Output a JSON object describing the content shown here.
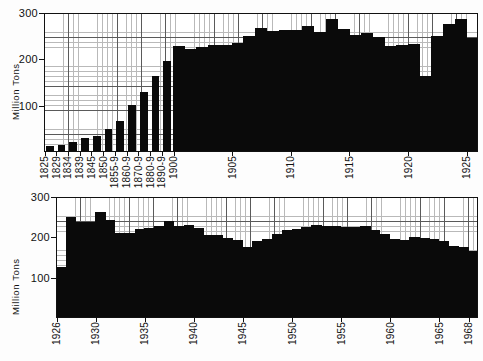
{
  "figure": {
    "background": "#ffffff",
    "bar_color": "#0a0a0a",
    "grid_major_color": "#5a5a5a",
    "grid_minor_color": "#b9b9b9",
    "axis_color": "#111111"
  },
  "chart_data": [
    {
      "type": "bar",
      "id": "top-panel",
      "title": "",
      "xlabel": "",
      "ylabel": "Million Tons",
      "ylim": [
        0,
        300
      ],
      "yticks": [
        100,
        200,
        300
      ],
      "ytick_labels": [
        "100",
        "200",
        "300"
      ],
      "grid": true,
      "legend": "none",
      "axis_note": "Early entries are period averages (5- or 10-year); later entries are single years.",
      "categories": [
        "1825",
        "1829",
        "1834",
        "1839",
        "1845",
        "1850",
        "1855-9",
        "1860-9",
        "1870-9",
        "1880-9",
        "1890-9",
        "1900",
        "1901",
        "1902",
        "1903",
        "1904",
        "1905",
        "1906",
        "1907",
        "1908",
        "1909",
        "1910",
        "1911",
        "1912",
        "1913",
        "1914",
        "1915",
        "1916",
        "1917",
        "1918",
        "1919",
        "1920",
        "1921",
        "1922",
        "1923",
        "1924",
        "1925"
      ],
      "tick_categories": [
        "1825",
        "1829",
        "1834",
        "1839",
        "1845",
        "1850",
        "1855-9",
        "1860-9",
        "1870-9",
        "1880-9",
        "1890-9",
        "1900",
        "1905",
        "1910",
        "1915",
        "1920",
        "1925"
      ],
      "values": [
        12,
        16,
        21,
        30,
        34,
        50,
        68,
        101,
        130,
        165,
        196,
        228,
        222,
        227,
        230,
        232,
        236,
        251,
        268,
        262,
        264,
        264,
        272,
        260,
        287,
        266,
        253,
        256,
        249,
        228,
        230,
        233,
        163,
        250,
        276,
        288,
        247
      ]
    },
    {
      "type": "bar",
      "id": "bottom-panel",
      "title": "",
      "xlabel": "",
      "ylabel": "Million Tons",
      "ylim": [
        0,
        300
      ],
      "yticks": [
        100,
        200,
        300
      ],
      "ytick_labels": [
        "100",
        "200",
        "300"
      ],
      "grid": true,
      "legend": "none",
      "categories": [
        "1926",
        "1927",
        "1928",
        "1929",
        "1930",
        "1931",
        "1932",
        "1933",
        "1934",
        "1935",
        "1936",
        "1937",
        "1938",
        "1939",
        "1940",
        "1941",
        "1942",
        "1943",
        "1944",
        "1945",
        "1946",
        "1947",
        "1948",
        "1949",
        "1950",
        "1951",
        "1952",
        "1953",
        "1954",
        "1955",
        "1956",
        "1957",
        "1958",
        "1959",
        "1960",
        "1961",
        "1962",
        "1963",
        "1964",
        "1965",
        "1966",
        "1967",
        "1968"
      ],
      "tick_categories": [
        "1926",
        "1930",
        "1935",
        "1940",
        "1945",
        "1950",
        "1955",
        "1960",
        "1965",
        "1968"
      ],
      "values": [
        126,
        251,
        238,
        238,
        262,
        244,
        212,
        210,
        221,
        222,
        228,
        240,
        227,
        231,
        224,
        206,
        205,
        199,
        193,
        175,
        190,
        197,
        209,
        218,
        220,
        226,
        230,
        228,
        228,
        225,
        226,
        227,
        219,
        209,
        197,
        193,
        200,
        199,
        196,
        191,
        178,
        175,
        167
      ]
    }
  ]
}
